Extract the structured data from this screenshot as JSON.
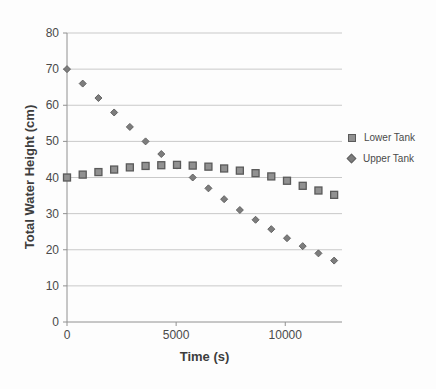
{
  "chart_data": {
    "type": "scatter",
    "title": "",
    "xlabel": "Time (s)",
    "ylabel": "Total Water Height (cm)",
    "xlim": [
      0,
      12600
    ],
    "ylim": [
      0,
      80
    ],
    "x_ticks": [
      0,
      5000,
      10000
    ],
    "y_ticks": [
      0,
      10,
      20,
      30,
      40,
      50,
      60,
      70,
      80
    ],
    "grid": "horizontal-major",
    "legend_position": "right",
    "x": [
      0,
      720,
      1440,
      2160,
      2880,
      3600,
      4320,
      5040,
      5760,
      6480,
      7200,
      7920,
      8640,
      9360,
      10080,
      10800,
      11520,
      12240
    ],
    "series": [
      {
        "name": "Lower Tank",
        "marker": "square",
        "fill": "#919191",
        "stroke": "#5a5a5a",
        "values": [
          40,
          40.8,
          41.5,
          42.2,
          42.8,
          43.2,
          43.4,
          43.5,
          43.3,
          43,
          42.5,
          41.9,
          41.2,
          40.3,
          39.1,
          37.7,
          36.4,
          35.2
        ]
      },
      {
        "name": "Upper Tank",
        "marker": "diamond",
        "fill": "#7d7d7d",
        "stroke": "#636363",
        "values": [
          70,
          66,
          62,
          58,
          54,
          50,
          46.5,
          43.3,
          40,
          37,
          34,
          31,
          28.3,
          25.7,
          23.2,
          21,
          19,
          17
        ]
      }
    ],
    "colors": {
      "gridline": "#c9c9c9",
      "axis": "#909090",
      "tick_label": "#4a4a4a",
      "axis_title": "#3d3d3d",
      "background": "#fdfdfd"
    }
  }
}
